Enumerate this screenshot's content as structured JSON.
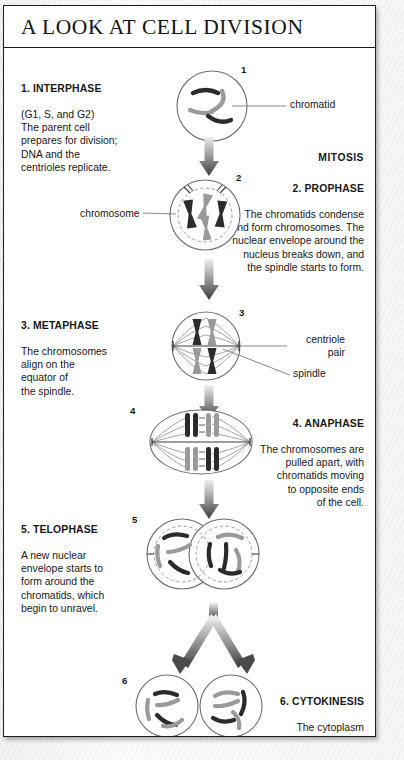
{
  "page": {
    "title": "A LOOK AT CELL DIVISION",
    "mitosis_bracket_label": "MITOSIS"
  },
  "colors": {
    "ink": "#181818",
    "frame": "#1c1c1c",
    "chromatid_dark": "#2b2b2b",
    "chromatid_gray": "#9a9a9a",
    "cell_outline": "#6e6e6e",
    "spindle": "#8d8d8d",
    "arrow_dark": "#4a4a4a",
    "arrow_light": "#e8e8e8",
    "paper": "#ffffff"
  },
  "stages": [
    {
      "number": "1",
      "heading": "1. INTERPHASE",
      "body": "(G1, S, and G2)\nThe parent cell\nprepares for division;\nDNA and the\ncentrioles replicate.",
      "text_side": "left",
      "text_align": "left"
    },
    {
      "number": "2",
      "heading": "2. PROPHASE",
      "body": "The chromatids condense\nand form chromosomes. The\nnuclear envelope around the\nnucleus breaks down, and\nthe spindle starts to form.",
      "text_side": "right",
      "text_align": "right"
    },
    {
      "number": "3",
      "heading": "3. METAPHASE",
      "body": "The chromosomes\nalign on the\nequator of\nthe spindle.",
      "text_side": "left",
      "text_align": "left"
    },
    {
      "number": "4",
      "heading": "4. ANAPHASE",
      "body": "The chromosomes are\npulled apart, with\nchromatids moving\nto opposite ends\nof the cell.",
      "text_side": "right",
      "text_align": "right"
    },
    {
      "number": "5",
      "heading": "5. TELOPHASE",
      "body": "A new nuclear\nenvelope starts to\nform around the\nchromatids, which\nbegin to unravel.",
      "text_side": "left",
      "text_align": "left"
    },
    {
      "number": "6",
      "heading": "6. CYTOKINESIS",
      "body": "The cytoplasm\ndivides to leave\na pair of\ndaughter cells.",
      "text_side": "right",
      "text_align": "right"
    }
  ],
  "callouts": {
    "chromatid": "chromatid",
    "chromosome": "chromosome",
    "centriole_pair": "centriole\npair",
    "spindle": "spindle"
  },
  "diagram_data": {
    "type": "diagram",
    "subject": "mitosis and cytokinesis in an animal cell",
    "stage_count": 6,
    "flow": "vertical top-to-bottom, single column of cell illustrations with alternating side captions",
    "mitosis_spans_stages": [
      "2. PROPHASE",
      "3. METAPHASE",
      "4. ANAPHASE",
      "5. TELOPHASE"
    ],
    "cell_shapes": {
      "1": "circle, 4 unreplicated thin curved chromatids (2 dark, 2 gray)",
      "2": "circle with dashed inner nuclear envelope breaking down, 4 X-shaped condensed chromosomes, 2 centriole pairs at poles",
      "3": "circle with spindle fibers from 2 poles, 4 X-shaped chromosomes aligned on equator",
      "4": "ellipse with spindle, chromatids split into 2 groups pulled to opposite poles",
      "5": "two overlapping circles, each with dashed re-forming nuclear envelope and unravelling chromatids",
      "6": "two separate daughter cell circles, each with 4 loose chromatids"
    },
    "arrows": [
      "1→2",
      "2→3",
      "3→4",
      "4→5",
      "5→6 forked into two"
    ]
  }
}
